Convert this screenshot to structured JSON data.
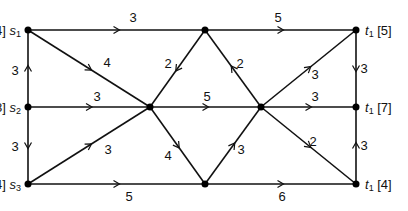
{
  "diagram": {
    "colors": {
      "stroke": "#111111",
      "node": "#000000",
      "background": "#ffffff"
    },
    "nodes": [
      {
        "id": "s1",
        "x": 28,
        "y": 30,
        "name": "s",
        "sub": "1",
        "supply": "[4]",
        "label_side": "left"
      },
      {
        "id": "a",
        "x": 205,
        "y": 30,
        "name": "",
        "sub": "",
        "supply": "",
        "label_side": "none"
      },
      {
        "id": "t1a",
        "x": 356,
        "y": 30,
        "name": "t",
        "sub": "1",
        "supply": "[5]",
        "label_side": "right"
      },
      {
        "id": "s2",
        "x": 28,
        "y": 107,
        "name": "s",
        "sub": "2",
        "supply": "[8]",
        "label_side": "left"
      },
      {
        "id": "b",
        "x": 150,
        "y": 107,
        "name": "",
        "sub": "",
        "supply": "",
        "label_side": "none"
      },
      {
        "id": "c",
        "x": 261,
        "y": 107,
        "name": "",
        "sub": "",
        "supply": "",
        "label_side": "none"
      },
      {
        "id": "t1b",
        "x": 356,
        "y": 107,
        "name": "t",
        "sub": "1",
        "supply": "[7]",
        "label_side": "right"
      },
      {
        "id": "s3",
        "x": 28,
        "y": 184,
        "name": "s",
        "sub": "3",
        "supply": "[4]",
        "label_side": "left"
      },
      {
        "id": "d",
        "x": 205,
        "y": 184,
        "name": "",
        "sub": "",
        "supply": "",
        "label_side": "none"
      },
      {
        "id": "t1c",
        "x": 356,
        "y": 184,
        "name": "t",
        "sub": "1",
        "supply": "[4]",
        "label_side": "right"
      }
    ],
    "edges": [
      {
        "from": "s1",
        "to": "a",
        "weight": "3",
        "lx": 133,
        "ly": 22
      },
      {
        "from": "a",
        "to": "t1a",
        "weight": "5",
        "lx": 278,
        "ly": 22
      },
      {
        "from": "s1",
        "to": "b",
        "weight": "4",
        "lx": 107,
        "ly": 67
      },
      {
        "from": "a",
        "to": "b",
        "weight": "2",
        "lx": 168,
        "ly": 68
      },
      {
        "from": "c",
        "to": "a",
        "weight": "2",
        "lx": 240,
        "ly": 68
      },
      {
        "from": "c",
        "to": "t1a",
        "weight": "3",
        "lx": 315,
        "ly": 79
      },
      {
        "from": "t1a",
        "to": "t1b",
        "weight": "3",
        "lx": 364,
        "ly": 73
      },
      {
        "from": "s2",
        "to": "s1",
        "weight": "3",
        "lx": 15,
        "ly": 75
      },
      {
        "from": "s2",
        "to": "b",
        "weight": "3",
        "lx": 97,
        "ly": 101
      },
      {
        "from": "b",
        "to": "c",
        "weight": "5",
        "lx": 207,
        "ly": 101
      },
      {
        "from": "c",
        "to": "t1b",
        "weight": "3",
        "lx": 315,
        "ly": 101
      },
      {
        "from": "s2",
        "to": "s3",
        "weight": "3",
        "lx": 15,
        "ly": 151
      },
      {
        "from": "s3",
        "to": "b",
        "weight": "3",
        "lx": 108,
        "ly": 154
      },
      {
        "from": "b",
        "to": "d",
        "weight": "4",
        "lx": 168,
        "ly": 160
      },
      {
        "from": "d",
        "to": "c",
        "weight": "3",
        "lx": 241,
        "ly": 154
      },
      {
        "from": "c",
        "to": "t1c",
        "weight": "2",
        "lx": 313,
        "ly": 146
      },
      {
        "from": "t1c",
        "to": "t1b",
        "weight": "3",
        "lx": 364,
        "ly": 150
      },
      {
        "from": "s3",
        "to": "d",
        "weight": "5",
        "lx": 129,
        "ly": 201
      },
      {
        "from": "d",
        "to": "t1c",
        "weight": "6",
        "lx": 282,
        "ly": 201
      }
    ]
  }
}
